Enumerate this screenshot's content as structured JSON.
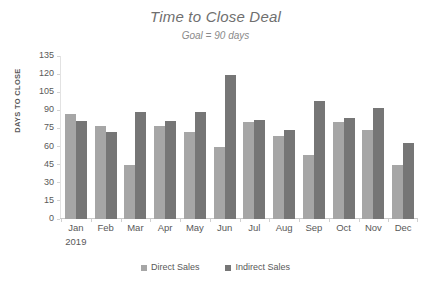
{
  "chart_data": {
    "type": "bar",
    "title": "Time to Close Deal",
    "subtitle": "Goal = 90 days",
    "xlabel": "2019",
    "ylabel": "DAYS TO CLOSE",
    "ylim": [
      0,
      135
    ],
    "yticks": [
      135,
      120,
      105,
      90,
      75,
      60,
      45,
      30,
      15,
      0
    ],
    "grid": false,
    "legend_position": "bottom",
    "categories": [
      "Jan",
      "Feb",
      "Mar",
      "Apr",
      "May",
      "Jun",
      "Jul",
      "Aug",
      "Sep",
      "Oct",
      "Nov",
      "Dec"
    ],
    "series": [
      {
        "name": "Direct Sales",
        "color": "#a6a6a6",
        "values": [
          87,
          77,
          45,
          77,
          72,
          60,
          80,
          69,
          53,
          80,
          74,
          45
        ]
      },
      {
        "name": "Indirect Sales",
        "color": "#767676",
        "values": [
          81,
          72,
          89,
          81,
          89,
          119,
          82,
          74,
          98,
          84,
          92,
          63
        ]
      }
    ]
  },
  "legend": {
    "items": [
      {
        "label": "Direct Sales"
      },
      {
        "label": "Indirect Sales"
      }
    ]
  }
}
